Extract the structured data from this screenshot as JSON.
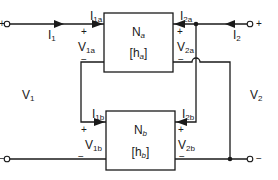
{
  "diagram": {
    "type": "two-port series-parallel interconnection",
    "networks": [
      {
        "id": "a",
        "name": "N",
        "sub": "a",
        "param_open": "[h",
        "param_sub": "a",
        "param_close": "]"
      },
      {
        "id": "b",
        "name": "N",
        "sub": "b",
        "param_open": "[h",
        "param_sub": "b",
        "param_close": "]"
      }
    ],
    "port_labels": {
      "I1": {
        "main": "I",
        "sub": "1"
      },
      "I2": {
        "main": "I",
        "sub": "2"
      },
      "V1": {
        "main": "V",
        "sub": "1"
      },
      "V2": {
        "main": "V",
        "sub": "2"
      },
      "I1a": {
        "main": "I",
        "sub": "1a"
      },
      "I2a": {
        "main": "I",
        "sub": "2a"
      },
      "V1a": {
        "main": "V",
        "sub": "1a"
      },
      "V2a": {
        "main": "V",
        "sub": "2a"
      },
      "I1b": {
        "main": "I",
        "sub": "1b"
      },
      "I2b": {
        "main": "I",
        "sub": "2b"
      },
      "V1b": {
        "main": "V",
        "sub": "1b"
      },
      "V2b": {
        "main": "V",
        "sub": "2b"
      }
    },
    "signs": {
      "plus": "+",
      "minus": "−"
    },
    "colors": {
      "line": "#1a1a1a",
      "background": "#ffffff"
    }
  }
}
